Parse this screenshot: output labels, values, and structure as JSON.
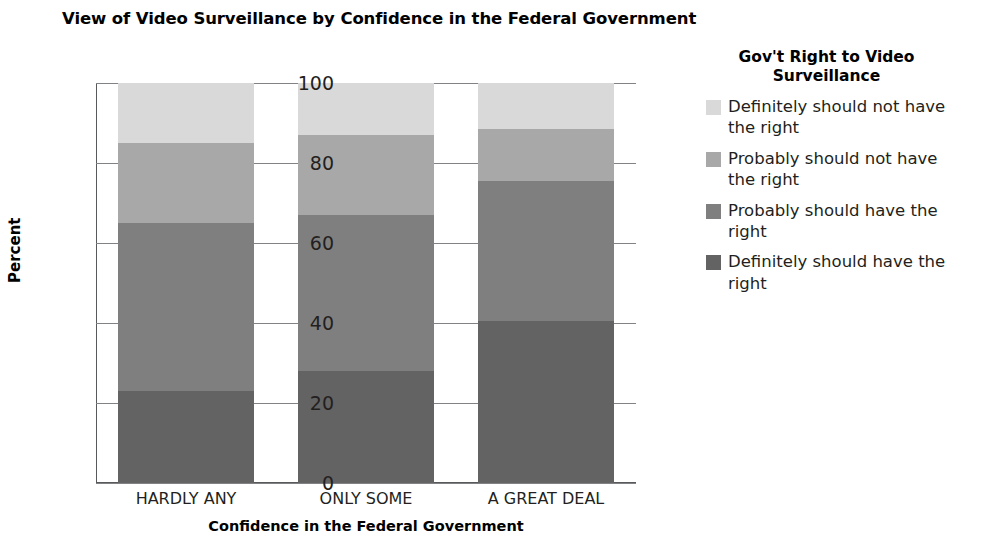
{
  "chart_data": {
    "type": "bar",
    "subtype": "stacked-percent",
    "title": "View of Video Surveillance by Confidence in the Federal Government",
    "xlabel": "Confidence in the Federal Government",
    "ylabel": "Percent",
    "categories": [
      "HARDLY ANY",
      "ONLY SOME",
      "A GREAT DEAL"
    ],
    "ylim": [
      0,
      100
    ],
    "yticks": [
      0,
      20,
      40,
      60,
      80,
      100
    ],
    "ytick_labels": [
      "0",
      "20",
      "40",
      "60",
      "80",
      "100"
    ],
    "grid": true,
    "legend_position": "right",
    "legend_title": "Gov't Right to Video Surveillance",
    "stack_order_bottom_to_top": [
      "Definitely should have the right",
      "Probably should have the right",
      "Probably should not have the right",
      "Definitely should not have the right"
    ],
    "series": [
      {
        "name": "Definitely should not have the right",
        "color": "#d9d9d9",
        "values": [
          15.0,
          13.0,
          11.5
        ]
      },
      {
        "name": "Probably should not have the right",
        "color": "#a8a8a8",
        "values": [
          20.0,
          20.0,
          13.0
        ]
      },
      {
        "name": "Probably should have the right",
        "color": "#7f7f7f",
        "values": [
          42.0,
          39.0,
          35.0
        ]
      },
      {
        "name": "Definitely should have the right",
        "color": "#636363",
        "values": [
          23.0,
          28.0,
          40.5
        ]
      }
    ],
    "cumulative_tops": {
      "HARDLY ANY": [
        23.0,
        65.0,
        85.0,
        100.0
      ],
      "ONLY SOME": [
        28.0,
        67.0,
        87.0,
        100.0
      ],
      "A GREAT DEAL": [
        40.5,
        75.5,
        88.5,
        100.0
      ]
    }
  },
  "legend": {
    "title": "Gov't Right to Video Surveillance",
    "items": [
      {
        "label": "Definitely should not have the right",
        "color": "#d9d9d9"
      },
      {
        "label": "Probably should not have the right",
        "color": "#a8a8a8"
      },
      {
        "label": "Probably should have the right",
        "color": "#7f7f7f"
      },
      {
        "label": "Definitely should have the right",
        "color": "#636363"
      }
    ]
  },
  "axis": {
    "y_title": "Percent",
    "x_title": "Confidence in the Federal Government"
  }
}
